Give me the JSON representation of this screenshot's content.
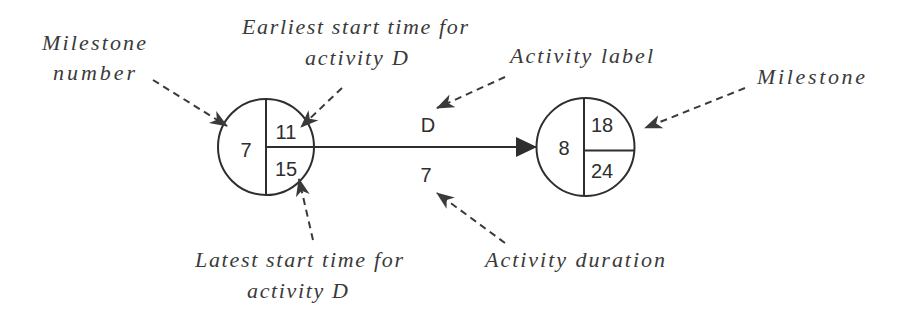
{
  "diagram": {
    "milestones": [
      {
        "number": "7",
        "earliest_start": "11",
        "latest_start": "15"
      },
      {
        "number": "8",
        "earliest_start": "18",
        "latest_start": "24"
      }
    ],
    "activity": {
      "label": "D",
      "duration": "7"
    },
    "annotations": {
      "milestone_number": [
        "Milestone",
        "number"
      ],
      "earliest_start": [
        "Earliest start time for",
        "activity D"
      ],
      "activity_label": "Activity label",
      "milestone": "Milestone",
      "latest_start": [
        "Latest start time for",
        "activity D"
      ],
      "activity_duration": "Activity duration"
    },
    "colors": {
      "stroke": "#2e2e2e",
      "annotation_text": "#3a3a3a",
      "background": "#ffffff"
    }
  }
}
